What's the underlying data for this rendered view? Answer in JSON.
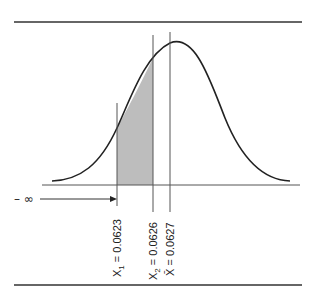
{
  "figure": {
    "title": "",
    "colors": {
      "line": "#222222",
      "rule": "#333333",
      "shade": "#bdbdbd",
      "vertical": "#555555"
    }
  },
  "labels": {
    "neg_infinity": "– ∞",
    "x1": {
      "name": "X",
      "subscript": "1",
      "value": " = 0.0623"
    },
    "x2": {
      "name": "X",
      "subscript": "2",
      "value": " = 0.0626"
    },
    "xbar": {
      "name": "X̄",
      "value": " = 0.0627"
    }
  },
  "markers": [
    {
      "id": "x1",
      "value": 0.0623
    },
    {
      "id": "x2",
      "value": 0.0626
    },
    {
      "id": "xbar",
      "value": 0.0627
    }
  ]
}
